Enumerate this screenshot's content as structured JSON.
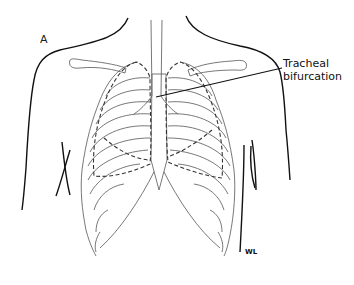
{
  "figure": {
    "panel_letter": "A",
    "labels": [
      {
        "id": "tracheal-bifurcation",
        "lines": [
          "Tracheal",
          "bifurcation"
        ]
      }
    ],
    "signature": "WL",
    "colors": {
      "line": "#111111",
      "bone": "#555555",
      "background": "#ffffff"
    }
  }
}
